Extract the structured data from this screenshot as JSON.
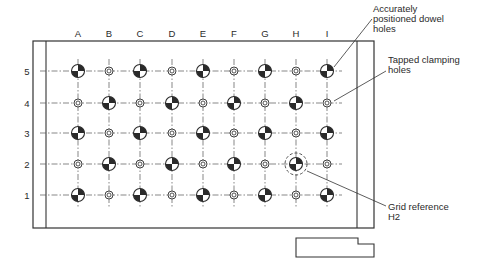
{
  "diagram": {
    "columns": [
      "A",
      "B",
      "C",
      "D",
      "E",
      "F",
      "G",
      "H",
      "I"
    ],
    "rows": [
      "5",
      "4",
      "3",
      "2",
      "1"
    ],
    "hole_types": {
      "dowel": "Accurately positioned dowel hole (quartered black/white)",
      "tapped": "Tapped clamping hole (concentric ring)"
    },
    "grid": [
      [
        "dowel",
        "tapped",
        "dowel",
        "tapped",
        "dowel",
        "tapped",
        "dowel",
        "tapped",
        "dowel"
      ],
      [
        "tapped",
        "dowel",
        "tapped",
        "dowel",
        "tapped",
        "dowel",
        "tapped",
        "dowel",
        "tapped"
      ],
      [
        "dowel",
        "tapped",
        "dowel",
        "tapped",
        "dowel",
        "tapped",
        "dowel",
        "tapped",
        "dowel"
      ],
      [
        "tapped",
        "dowel",
        "tapped",
        "dowel",
        "tapped",
        "dowel",
        "tapped",
        "dowel",
        "tapped"
      ],
      [
        "dowel",
        "tapped",
        "dowel",
        "tapped",
        "dowel",
        "tapped",
        "dowel",
        "tapped",
        "dowel"
      ]
    ],
    "highlight": {
      "column": "H",
      "row": "2"
    },
    "annotations": {
      "dowel": {
        "lines": [
          "Accurately",
          "positioned dowel",
          "holes"
        ],
        "target": {
          "column": "I",
          "row": "5"
        }
      },
      "tapped": {
        "lines": [
          "Tapped clamping",
          "holes"
        ],
        "target": {
          "column": "I",
          "row": "4"
        }
      },
      "grid_ref": {
        "lines": [
          "Grid reference",
          "H2"
        ],
        "target": {
          "column": "H",
          "row": "2"
        }
      }
    },
    "colors": {
      "ink": "#2a2a2a",
      "paper": "#ffffff"
    }
  }
}
